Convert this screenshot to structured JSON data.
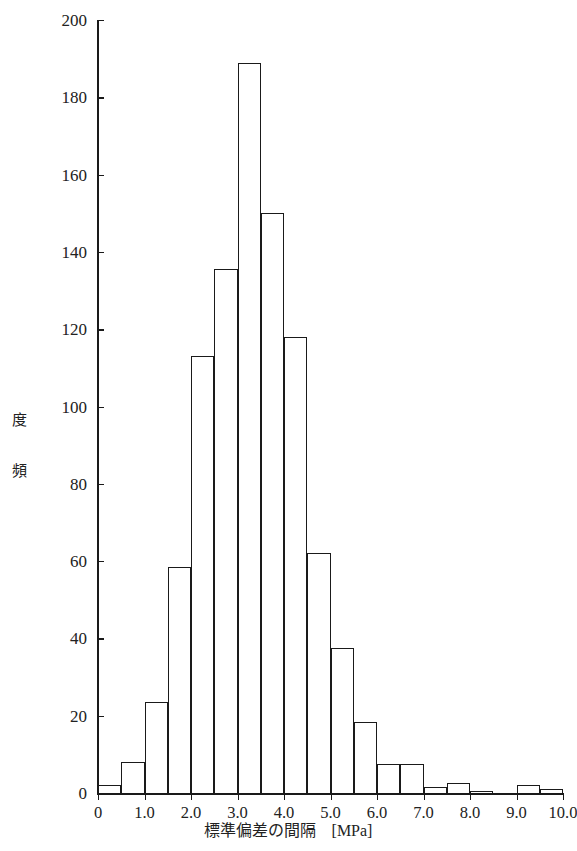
{
  "chart_data": {
    "type": "bar",
    "title": "",
    "xlabel": "標準偏差の間隔　[MPa]",
    "ylabel": "頻　度",
    "ylabel_chars": [
      "頻",
      "度"
    ],
    "xlim": [
      0,
      10.0
    ],
    "ylim": [
      0,
      200
    ],
    "bin_width": 0.5,
    "grid": false,
    "legend": null,
    "xtick_labels": [
      "0",
      "1.0",
      "2.0",
      "3.0",
      "4.0",
      "5.0",
      "6.0",
      "7.0",
      "8.0",
      "9.0",
      "10.0"
    ],
    "xtick_values": [
      0,
      1.0,
      2.0,
      3.0,
      4.0,
      5.0,
      6.0,
      7.0,
      8.0,
      9.0,
      10.0
    ],
    "xtick_minor_values": [
      0.5,
      1.5,
      2.5,
      3.5,
      4.5,
      5.5,
      6.5,
      7.5,
      8.5,
      9.5
    ],
    "ytick_labels": [
      "0",
      "20",
      "40",
      "60",
      "80",
      "100",
      "120",
      "140",
      "160",
      "180",
      "200"
    ],
    "ytick_values": [
      0,
      20,
      40,
      60,
      80,
      100,
      120,
      140,
      160,
      180,
      200
    ],
    "categories": [
      "0.0-0.5",
      "0.5-1.0",
      "1.0-1.5",
      "1.5-2.0",
      "2.0-2.5",
      "2.5-3.0",
      "3.0-3.5",
      "3.5-4.0",
      "4.0-4.5",
      "4.5-5.0",
      "5.0-5.5",
      "5.5-6.0",
      "6.0-6.5",
      "6.5-7.0",
      "7.0-7.5",
      "7.5-8.0",
      "8.0-8.5",
      "8.5-9.0",
      "9.0-9.5",
      "9.5-10.0"
    ],
    "bin_edges": [
      0.0,
      0.5,
      1.0,
      1.5,
      2.0,
      2.5,
      3.0,
      3.5,
      4.0,
      4.5,
      5.0,
      5.5,
      6.0,
      6.5,
      7.0,
      7.5,
      8.0,
      8.5,
      9.0,
      9.5,
      10.0
    ],
    "values": [
      2,
      8,
      23.5,
      58.5,
      113,
      135.5,
      189,
      150,
      118,
      62,
      37.5,
      18.5,
      7.5,
      7.5,
      1.5,
      2.5,
      0.5,
      0,
      2,
      1
    ]
  }
}
